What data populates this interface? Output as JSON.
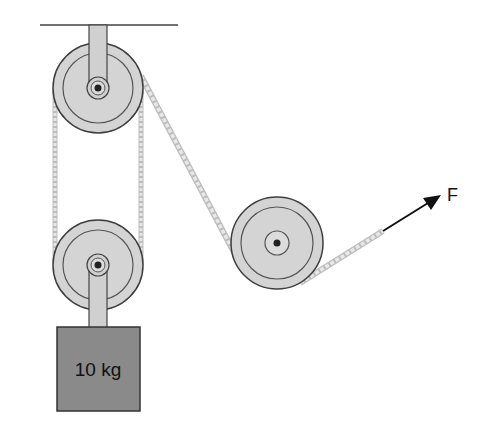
{
  "diagram": {
    "type": "pulley system",
    "mass_label": "10 kg",
    "force_label": "F",
    "components": [
      "ceiling",
      "fixed pulley (top)",
      "movable pulley (bottom)",
      "redirect pulley (right)",
      "rope",
      "10 kg block",
      "applied force arrow"
    ]
  },
  "colors": {
    "pulley_fill": "#d4d4d4",
    "pulley_stroke": "#4a4a4a",
    "block_fill": "#8a8a8a",
    "rope": "#d8d8d8",
    "arrow": "#111111"
  }
}
